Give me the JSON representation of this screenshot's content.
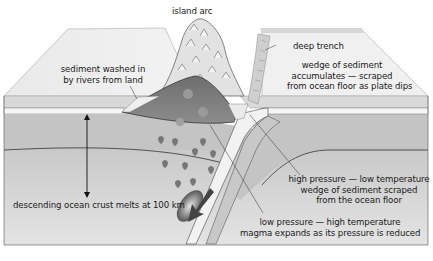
{
  "labels": {
    "island_arc": "island arc",
    "deep_trench": "deep trench",
    "wedge_accumulates": [
      "wedge of sediment",
      "accumulates — scraped",
      "from ocean floor as plate dips"
    ],
    "sediment_washed": [
      "sediment washed in",
      "by rivers from land"
    ],
    "descending_crust": "descending ocean crust melts at 100 km",
    "high_pressure": [
      "high pressure — low temperature",
      "wedge of sediment scraped",
      "from the ocean floor"
    ],
    "low_pressure": [
      "low pressure — high temperature",
      "magma expands as its pressure is reduced"
    ]
  },
  "colors": {
    "surface": "#e6e6e6",
    "surface_edge": "#bdbdbd",
    "crust": "#bfbfbf",
    "mantle": "#d4d4d4",
    "wedge_dark": "#7a7a7a",
    "slab_light": "#f2f2f2",
    "outline": "#333333"
  }
}
